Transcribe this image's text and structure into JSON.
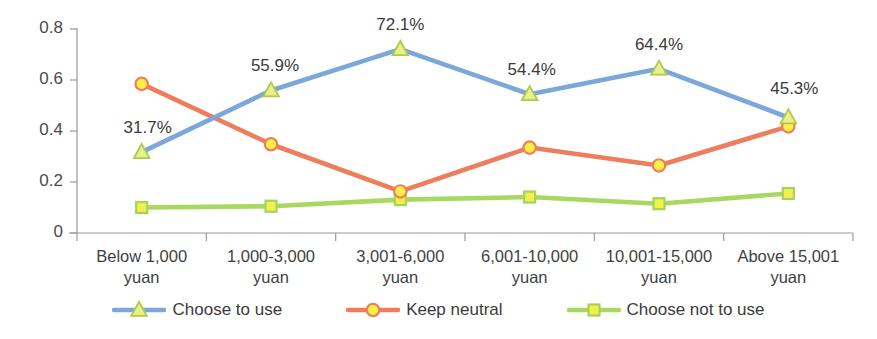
{
  "chart_data": {
    "type": "line",
    "title": "",
    "xlabel": "",
    "ylabel": "",
    "ylim": [
      0,
      0.8
    ],
    "yticks": [
      "0",
      "0.2",
      "0.4",
      "0.6",
      "0.8"
    ],
    "ytick_values": [
      0,
      0.2,
      0.4,
      0.6,
      0.8
    ],
    "grid": false,
    "legend_position": "bottom",
    "categories": [
      "Below 1,000 yuan",
      "1,000-3,000 yuan",
      "3,001-6,000 yuan",
      "6,001-10,000 yuan",
      "10,001-15,000 yuan",
      "Above 15,001 yuan"
    ],
    "category_lines": [
      [
        "Below 1,000",
        "yuan"
      ],
      [
        "1,000-3,000",
        "yuan"
      ],
      [
        "3,001-6,000",
        "yuan"
      ],
      [
        "6,001-10,000",
        "yuan"
      ],
      [
        "10,001-15,000",
        "yuan"
      ],
      [
        "Above 15,001",
        "yuan"
      ]
    ],
    "series": [
      {
        "name": "Choose to use",
        "values": [
          0.317,
          0.559,
          0.721,
          0.544,
          0.644,
          0.453
        ],
        "line_color": "#7BA7DA",
        "marker": "triangle",
        "marker_fill": "#E8F08A",
        "marker_stroke": "#AFC94C",
        "data_labels": [
          "31.7%",
          "55.9%",
          "72.1%",
          "54.4%",
          "64.4%",
          "45.3%"
        ]
      },
      {
        "name": "Keep neutral",
        "values": [
          0.585,
          0.348,
          0.163,
          0.335,
          0.265,
          0.418
        ],
        "line_color": "#ED7D5C",
        "marker": "circle",
        "marker_fill": "#FBEF4A",
        "marker_stroke": "#EE8058",
        "data_labels": []
      },
      {
        "name": "Choose not to use",
        "values": [
          0.1,
          0.105,
          0.131,
          0.141,
          0.115,
          0.155
        ],
        "line_color": "#A8D860",
        "marker": "square",
        "marker_fill": "#F5EF4D",
        "marker_stroke": "#A3D45B",
        "data_labels": []
      }
    ]
  },
  "legend": {
    "items": [
      {
        "label": "Choose to use"
      },
      {
        "label": "Keep neutral"
      },
      {
        "label": "Choose not to use"
      }
    ]
  },
  "axis": {
    "line_color": "#9a9a9a"
  }
}
